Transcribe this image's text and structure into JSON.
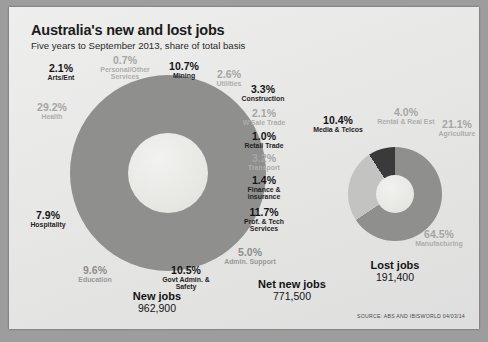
{
  "header": {
    "title": "Australia's new and lost jobs",
    "subtitle": "Five years to September 2013, share of total basis"
  },
  "source": "SOURCE: ABS AND IBISWORLD 04/03/14",
  "totals": {
    "new_jobs": {
      "label": "New jobs",
      "value": "962,900"
    },
    "net_new_jobs": {
      "label": "Net new jobs",
      "value": "771,500"
    },
    "lost_jobs": {
      "label": "Lost jobs",
      "value": "191,400"
    }
  },
  "colors": {
    "paper": "#e9e9e7",
    "mid_grey": "#8f8f8d",
    "dark": "#3a3a3a",
    "light_grey": "#c3c3c1",
    "white": "#fbfbfa",
    "ink": "#141414"
  },
  "chart_data": [
    {
      "type": "pie",
      "title": "New jobs",
      "subtitle": "Five years to September 2013, share of total basis",
      "total_label": "New jobs",
      "total_value": "962,900",
      "unit": "% share of total",
      "legend": "none",
      "categories": [
        "Health",
        "Arts/Ent",
        "Personal/Other Services",
        "Mining",
        "Utilities",
        "Construction",
        "W'Sale Trade",
        "Retail Trade",
        "Transport",
        "Finance & insurance",
        "Prof. & Tech Services",
        "Admin. Support",
        "Govt Admin. & Safety",
        "Education",
        "Hospitality"
      ],
      "values": [
        29.2,
        2.1,
        0.7,
        10.7,
        2.6,
        3.3,
        2.1,
        1.0,
        3.2,
        1.4,
        11.7,
        5.0,
        10.5,
        9.6,
        7.9
      ],
      "labels": [
        "29.2%",
        "2.1%",
        "0.7%",
        "10.7%",
        "2.6%",
        "3.3%",
        "2.1%",
        "1.0%",
        "3.2%",
        "1.4%",
        "11.7%",
        "5.0%",
        "10.5%",
        "9.6%",
        "7.9%"
      ]
    },
    {
      "type": "pie",
      "title": "Lost jobs",
      "total_label": "Lost jobs",
      "total_value": "191,400",
      "unit": "% share of total",
      "legend": "none",
      "categories": [
        "Manufacturing",
        "Agriculture",
        "Rental & Real Est",
        "Media & Telcos"
      ],
      "values": [
        64.5,
        21.1,
        4.0,
        10.4
      ],
      "labels": [
        "64.5%",
        "21.1%",
        "4.0%",
        "10.4%"
      ]
    }
  ],
  "new_jobs_labels": {
    "health": {
      "pct": "29.2%",
      "name": "Health"
    },
    "arts": {
      "pct": "2.1%",
      "name": "Arts/Ent"
    },
    "personal": {
      "pct": "0.7%",
      "name": "Personal/Other\nServices"
    },
    "mining": {
      "pct": "10.7%",
      "name": "Mining"
    },
    "utilities": {
      "pct": "2.6%",
      "name": "Utilities"
    },
    "construction": {
      "pct": "3.3%",
      "name": "Construction"
    },
    "wsale": {
      "pct": "2.1%",
      "name": "W'Sale Trade"
    },
    "retail": {
      "pct": "1.0%",
      "name": "Retail Trade"
    },
    "transport": {
      "pct": "3.2%",
      "name": "Transport"
    },
    "finance": {
      "pct": "1.4%",
      "name": "Finance &\ninsurance"
    },
    "proftech": {
      "pct": "11.7%",
      "name": "Prof. & Tech\nServices"
    },
    "admin": {
      "pct": "5.0%",
      "name": "Admin. Support"
    },
    "govt": {
      "pct": "10.5%",
      "name": "Govt Admin. &\nSafety"
    },
    "education": {
      "pct": "9.6%",
      "name": "Education"
    },
    "hospitality": {
      "pct": "7.9%",
      "name": "Hospitality"
    }
  },
  "lost_jobs_labels": {
    "media": {
      "pct": "10.4%",
      "name": "Media & Telcos"
    },
    "rental": {
      "pct": "4.0%",
      "name": "Rental & Real Est"
    },
    "agriculture": {
      "pct": "21.1%",
      "name": "Agriculture"
    },
    "manufacturing": {
      "pct": "64.5%",
      "name": "Manufacturing"
    }
  }
}
